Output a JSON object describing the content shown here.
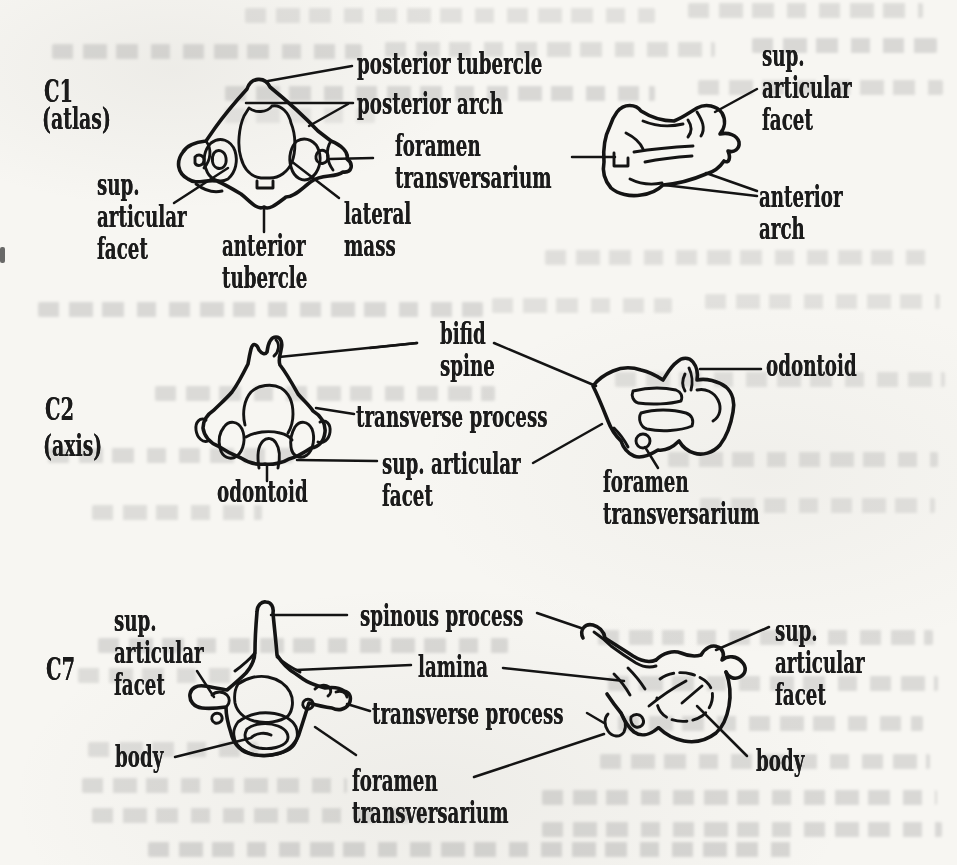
{
  "page": {
    "paper_color": "#f7f6f2",
    "ink_color": "#141414",
    "bleedthrough_text_visible": true
  },
  "sections": [
    {
      "label": "C1",
      "sublabel": "(atlas)",
      "views": [
        "superior view",
        "lateral view"
      ],
      "annotations": [
        {
          "text": "posterior tubercle"
        },
        {
          "text": "posterior arch"
        },
        {
          "text": "foramen\ntransversarium"
        },
        {
          "text": "sup.\narticular\nfacet"
        },
        {
          "text": "anterior\ntubercle"
        },
        {
          "text": "lateral\nmass"
        },
        {
          "text": "sup.\narticular\nfacet"
        },
        {
          "text": "anterior\narch"
        }
      ]
    },
    {
      "label": "C2",
      "sublabel": "(axis)",
      "views": [
        "posterior view",
        "lateral view"
      ],
      "annotations": [
        {
          "text": "bifid\nspine"
        },
        {
          "text": "transverse process"
        },
        {
          "text": "sup. articular\nfacet"
        },
        {
          "text": "odontoid"
        },
        {
          "text": "odontoid"
        },
        {
          "text": "foramen\ntransversarium"
        }
      ]
    },
    {
      "label": "C7",
      "sublabel": "",
      "views": [
        "superior view",
        "lateral view"
      ],
      "annotations": [
        {
          "text": "sup.\narticular\nfacet"
        },
        {
          "text": "spinous process"
        },
        {
          "text": "lamina"
        },
        {
          "text": "transverse process"
        },
        {
          "text": "body"
        },
        {
          "text": "foramen\ntransversarium"
        },
        {
          "text": "sup. articular\nfacet"
        },
        {
          "text": "body"
        }
      ]
    }
  ]
}
